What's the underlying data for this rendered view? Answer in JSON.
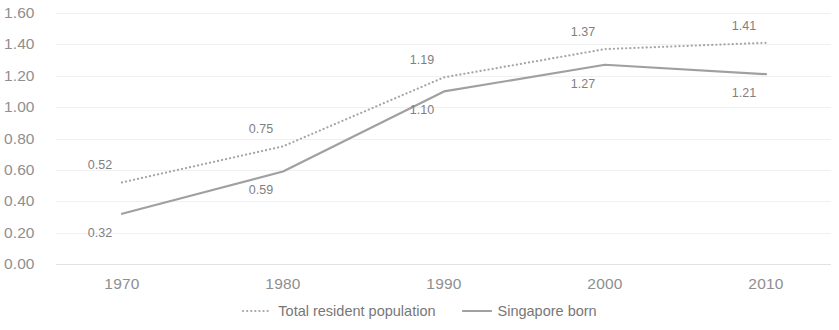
{
  "chart_data": {
    "type": "line",
    "title": "",
    "subtitle": "",
    "xlabel": "",
    "ylabel": "",
    "categories": [
      "1970",
      "1980",
      "1990",
      "2000",
      "2010"
    ],
    "x_tick_labels": [
      "1970",
      "1980",
      "1990",
      "2000",
      "2010"
    ],
    "y_tick_labels": [
      "1.60",
      "1.40",
      "1.20",
      "1.00",
      "0.80",
      "0.60",
      "0.40",
      "0.20",
      "0.00"
    ],
    "y_tick_values": [
      1.6,
      1.4,
      1.2,
      1.0,
      0.8,
      0.6,
      0.4,
      0.2,
      0.0
    ],
    "ylim": [
      0.0,
      1.6
    ],
    "grid": true,
    "grid_axis": "y",
    "legend_position": "bottom",
    "series": [
      {
        "name": "Total resident population",
        "style": "dotted",
        "color": "#a6a6a6",
        "values": [
          0.52,
          0.75,
          1.19,
          1.37,
          1.41
        ],
        "data_labels": [
          "0.52",
          "0.75",
          "1.19",
          "1.37",
          "1.41"
        ],
        "label_position": "above"
      },
      {
        "name": "Singapore born",
        "style": "solid",
        "color": "#a0a0a0",
        "values": [
          0.32,
          0.59,
          1.1,
          1.27,
          1.21
        ],
        "data_labels": [
          "0.32",
          "0.59",
          "1.10",
          "1.27",
          "1.21"
        ],
        "label_position": "below"
      }
    ],
    "colors": {
      "gridline": "#f0f0f0",
      "axis": "#e2e2e2",
      "tick_text": "#8f8f8f",
      "data_label_text": "#7f7f7f",
      "legend_text": "#777777",
      "background": "#ffffff"
    }
  },
  "legend": {
    "entries": [
      {
        "label": "Total resident population",
        "marker": "dotted-line-icon"
      },
      {
        "label": "Singapore born",
        "marker": "solid-line-icon"
      }
    ]
  }
}
